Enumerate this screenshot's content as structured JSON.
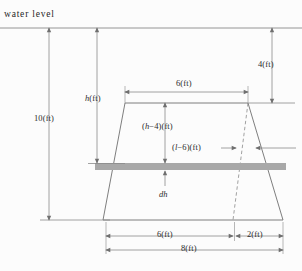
{
  "figure": {
    "title": "water level",
    "colors": {
      "background": "#fcfcfc",
      "stroke": "#6f6f6f",
      "text": "#2b2b2b",
      "strip_fill": "#a8a8a8"
    }
  },
  "labels": {
    "water_level": "water level",
    "total_depth": "10(ft)",
    "depth_h": "h(ft)",
    "freeboard": "4(ft)",
    "top_width": "6(ft)",
    "strip_above": "(h−4)(ft)",
    "strip_half_extra": "(l−6)(ft)",
    "strip_thickness": "dh",
    "base_inner": "6(ft)",
    "base_outer": "2(ft)",
    "base_total": "8(ft)"
  },
  "math_parts": {
    "h_var": "h",
    "ft_unit": "(ft)",
    "h_minus_4_open": "(",
    "h_minus_4_var": "h",
    "h_minus_4_rest": "−4)(ft)",
    "l_minus_6_open": "(",
    "l_minus_6_var": "l",
    "l_minus_6_rest": "−6)(ft)",
    "dh_d": "d",
    "dh_h": "h"
  },
  "geometry": {
    "water_level_y": 28,
    "top_edge_y": 103,
    "strip_y": 166,
    "base_y": 220,
    "trap_top_left_x": 125,
    "trap_top_right_x": 248,
    "trap_base_left_x": 103,
    "trap_base_right_x": 283,
    "dashed_base_x": 233,
    "strip_left_x": 95,
    "strip_right_x": 286,
    "strip_height": 7
  },
  "dimension_lines": [
    {
      "name": "total-depth",
      "label": "10(ft)",
      "orientation": "vertical",
      "x": 49,
      "from_y": 28,
      "to_y": 220
    },
    {
      "name": "depth-h",
      "label": "h(ft)",
      "orientation": "vertical",
      "x": 97,
      "from_y": 28,
      "to_y": 163
    },
    {
      "name": "freeboard",
      "label": "4(ft)",
      "orientation": "vertical",
      "x": 272,
      "from_y": 28,
      "to_y": 103
    },
    {
      "name": "top-width",
      "label": "6(ft)",
      "orientation": "horizontal",
      "y": 92,
      "from_x": 125,
      "to_x": 248
    },
    {
      "name": "strip-above",
      "label": "(h−4)(ft)",
      "orientation": "vertical",
      "x": 165,
      "from_y": 103,
      "to_y": 163
    },
    {
      "name": "strip-thickness",
      "label": "dh",
      "orientation": "vertical",
      "x": 165,
      "from_y": 186,
      "to_y": 170
    },
    {
      "name": "base-inner",
      "label": "6(ft)",
      "orientation": "horizontal",
      "y": 236,
      "from_x": 106,
      "to_x": 233
    },
    {
      "name": "base-outer",
      "label": "2(ft)",
      "orientation": "horizontal",
      "y": 236,
      "from_x": 236,
      "to_x": 283
    },
    {
      "name": "base-total",
      "label": "8(ft)",
      "orientation": "horizontal",
      "y": 250,
      "from_x": 106,
      "to_x": 283
    }
  ]
}
